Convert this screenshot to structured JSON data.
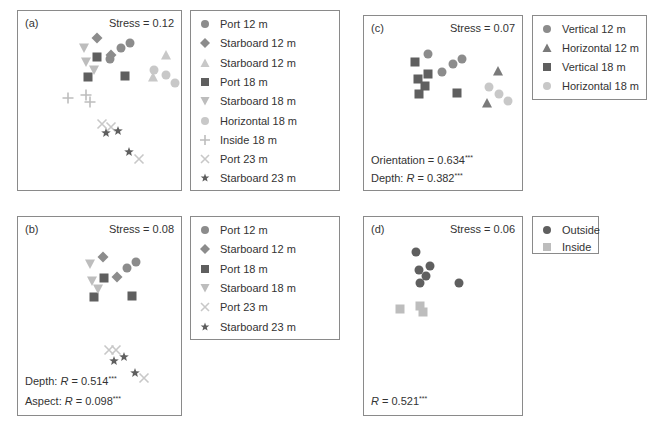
{
  "colors": {
    "dark": "#5f5f5f",
    "mid": "#8c8c8c",
    "light": "#bdbdbd",
    "lighter": "#cfcfcf",
    "border": "#8a8a8a"
  },
  "chart_data": [
    {
      "type": "scatter",
      "title": "(a)",
      "stress_label": "Stress = 0.12",
      "stats": [],
      "legend": [
        "Port 12 m",
        "Starboard 12 m",
        "Starboard 12 m",
        "Port 18 m",
        "Starboard 18 m",
        "Horizontal 18 m",
        "Inside 18 m",
        "Port 23 m",
        "Starboard 23 m"
      ],
      "series": [
        {
          "name": "Port 12 m",
          "marker": "circle",
          "color": "#8c8c8c",
          "points": [
            [
              92,
              48
            ],
            [
              103,
              37
            ],
            [
              112,
              32
            ]
          ]
        },
        {
          "name": "Starboard 12 m",
          "marker": "diamond",
          "color": "#8c8c8c",
          "points": [
            [
              79,
              27
            ],
            [
              93,
              44
            ]
          ]
        },
        {
          "name": "Starboard 12 m (triangle)",
          "marker": "triangle-up",
          "color": "#c8c8c8",
          "points": [
            [
              148,
              44
            ],
            [
              135,
              66
            ]
          ]
        },
        {
          "name": "Port 18 m",
          "marker": "square",
          "color": "#5f5f5f",
          "points": [
            [
              79,
              46
            ],
            [
              70,
              66
            ],
            [
              107,
              65
            ]
          ]
        },
        {
          "name": "Starboard 18 m",
          "marker": "triangle-down",
          "color": "#bdbdbd",
          "points": [
            [
              66,
              37
            ],
            [
              68,
              51
            ],
            [
              76,
              59
            ]
          ]
        },
        {
          "name": "Horizontal 18 m",
          "marker": "circle",
          "color": "#c8c8c8",
          "points": [
            [
              136,
              59
            ],
            [
              148,
              64
            ],
            [
              157,
              72
            ]
          ]
        },
        {
          "name": "Inside 18 m",
          "marker": "plus",
          "color": "#bdbdbd",
          "points": [
            [
              50,
              87
            ],
            [
              68,
              84
            ],
            [
              72,
              91
            ]
          ]
        },
        {
          "name": "Port 23 m",
          "marker": "x",
          "color": "#c8c8c8",
          "points": [
            [
              84,
              113
            ],
            [
              93,
              116
            ],
            [
              121,
              148
            ]
          ]
        },
        {
          "name": "Starboard 23 m",
          "marker": "star",
          "color": "#5f5f5f",
          "points": [
            [
              88,
              122
            ],
            [
              100,
              120
            ],
            [
              111,
              141
            ]
          ]
        }
      ]
    },
    {
      "type": "scatter",
      "title": "(b)",
      "stress_label": "Stress = 0.08",
      "stats": [
        "Depth: R = 0.514***",
        "Aspect: R = 0.098***"
      ],
      "legend": [
        "Port 12 m",
        "Starboard 12 m",
        "Port 18 m",
        "Starboard 18 m",
        "Port 23 m",
        "Starboard 23 m"
      ],
      "series": [
        {
          "name": "Port 12 m",
          "marker": "circle",
          "color": "#8c8c8c",
          "points": [
            [
              109,
              51
            ],
            [
              118,
              45
            ]
          ]
        },
        {
          "name": "Starboard 12 m",
          "marker": "diamond",
          "color": "#8c8c8c",
          "points": [
            [
              85,
              40
            ],
            [
              99,
              60
            ]
          ]
        },
        {
          "name": "Port 18 m",
          "marker": "square",
          "color": "#5f5f5f",
          "points": [
            [
              86,
              61
            ],
            [
              76,
              80
            ],
            [
              114,
              79
            ]
          ]
        },
        {
          "name": "Starboard 18 m",
          "marker": "triangle-down",
          "color": "#bdbdbd",
          "points": [
            [
              72,
              47
            ],
            [
              74,
              64
            ],
            [
              80,
              72
            ]
          ]
        },
        {
          "name": "Port 23 m",
          "marker": "x",
          "color": "#c8c8c8",
          "points": [
            [
              91,
              133
            ],
            [
              98,
              133
            ],
            [
              126,
              161
            ]
          ]
        },
        {
          "name": "Starboard 23 m",
          "marker": "star",
          "color": "#5f5f5f",
          "points": [
            [
              96,
              144
            ],
            [
              106,
              140
            ],
            [
              117,
              156
            ]
          ]
        }
      ]
    },
    {
      "type": "scatter",
      "title": "(c)",
      "stress_label": "Stress = 0.07",
      "stats": [
        "Orientation = 0.634***",
        "Depth: R = 0.382***"
      ],
      "legend": [
        "Vertical 12 m",
        "Horizontal 12 m",
        "Vertical 18 m",
        "Horizontal 18 m"
      ],
      "series": [
        {
          "name": "Vertical 12 m",
          "marker": "circle",
          "color": "#8c8c8c",
          "points": [
            [
              64,
              38
            ],
            [
              78,
              56
            ],
            [
              89,
              48
            ],
            [
              98,
              43
            ]
          ]
        },
        {
          "name": "Horizontal 12 m",
          "marker": "triangle-up",
          "color": "#7a7a7a",
          "points": [
            [
              134,
              55
            ],
            [
              123,
              87
            ]
          ]
        },
        {
          "name": "Vertical 18 m",
          "marker": "square",
          "color": "#5f5f5f",
          "points": [
            [
              51,
              46
            ],
            [
              64,
              58
            ],
            [
              54,
              63
            ],
            [
              61,
              70
            ],
            [
              55,
              78
            ],
            [
              93,
              77
            ]
          ]
        },
        {
          "name": "Horizontal 18 m",
          "marker": "circle",
          "color": "#c8c8c8",
          "points": [
            [
              125,
              71
            ],
            [
              135,
              78
            ],
            [
              144,
              85
            ]
          ]
        }
      ]
    },
    {
      "type": "scatter",
      "title": "(d)",
      "stress_label": "Stress = 0.06",
      "stats": [
        "R = 0.521***"
      ],
      "legend": [
        "Outside",
        "Inside"
      ],
      "series": [
        {
          "name": "Outside",
          "marker": "circle",
          "color": "#5f5f5f",
          "points": [
            [
              52,
              35
            ],
            [
              55,
              53
            ],
            [
              66,
              49
            ],
            [
              62,
              59
            ],
            [
              56,
              66
            ],
            [
              95,
              66
            ]
          ]
        },
        {
          "name": "Inside",
          "marker": "square",
          "color": "#bdbdbd",
          "points": [
            [
              36,
              92
            ],
            [
              56,
              89
            ],
            [
              59,
              95
            ]
          ]
        }
      ]
    }
  ],
  "panels": {
    "a": {
      "label": "(a)",
      "stress": "Stress = 0.12"
    },
    "b": {
      "label": "(b)",
      "stress": "Stress = 0.08",
      "stat1_prefix": "Depth: ",
      "stat1_R": "R",
      "stat1_val": " = 0.514",
      "stat1_sig": "***",
      "stat2_prefix": "Aspect: ",
      "stat2_R": "R",
      "stat2_val": " = 0.098",
      "stat2_sig": "***"
    },
    "c": {
      "label": "(c)",
      "stress": "Stress = 0.07",
      "stat1_text": "Orientation = 0.634",
      "stat1_sig": "***",
      "stat2_prefix": "Depth: ",
      "stat2_R": "R",
      "stat2_val": " = 0.382",
      "stat2_sig": "***"
    },
    "d": {
      "label": "(d)",
      "stress": "Stress = 0.06",
      "stat1_R": "R",
      "stat1_val": " = 0.521",
      "stat1_sig": "***"
    }
  },
  "legends": {
    "a": [
      "Port 12 m",
      "Starboard 12 m",
      "Starboard 12 m",
      "Port 18 m",
      "Starboard 18 m",
      "Horizontal 18 m",
      "Inside 18 m",
      "Port 23 m",
      "Starboard 23 m"
    ],
    "b": [
      "Port 12 m",
      "Starboard 12 m",
      "Port 18 m",
      "Starboard 18 m",
      "Port 23 m",
      "Starboard 23 m"
    ],
    "c": [
      "Vertical 12 m",
      "Horizontal 12 m",
      "Vertical 18 m",
      "Horizontal 18 m"
    ],
    "d": [
      "Outside",
      "Inside"
    ]
  }
}
